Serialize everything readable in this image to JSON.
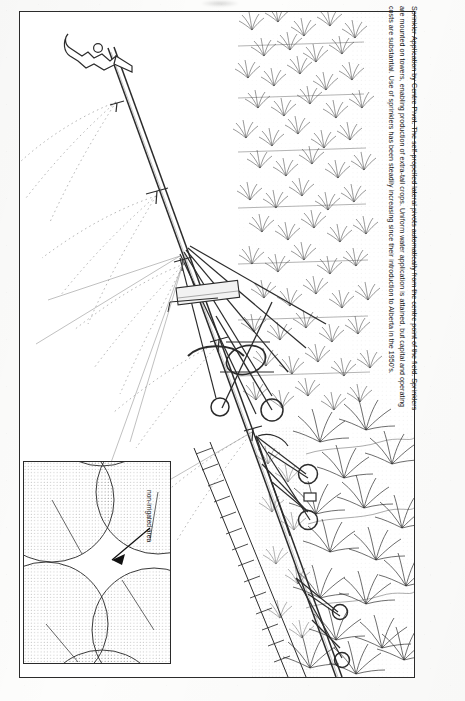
{
  "figure": {
    "title": "Sprinkler Application by Centre Pivot",
    "caption_lines": [
      "Sprinkler Application by Centre Pivot. The self-propelled lateral pivots automatically from the centre point of the field. Sprinklers",
      "are mounted on towers, enabling production of extra-tall crops. Uniform water application is attained, but capital and operating",
      "costs are substantial. Use of sprinklers has been steadily increasing since their introduction to Alberta in the 1950's."
    ]
  },
  "inset": {
    "label": "non-irrigated area",
    "description": "Plan view of four overlapping circular centre-pivot irrigation patterns showing the non-irrigated interstitial area",
    "pattern_count": 4
  },
  "illustration": {
    "subject": "centre pivot irrigation sprinkler system",
    "components": [
      "pivot lateral pipe",
      "sprinkler heads",
      "A-frame drive towers",
      "tower wheels",
      "truss rods",
      "crop rows",
      "water spray"
    ],
    "tower_count": 4,
    "sprinkler_head_count": 5
  },
  "colors": {
    "ink": "#2b2b2b",
    "paper": "#ffffff",
    "stipple": "#3a3a3a",
    "spray": "#5a5a5a"
  }
}
